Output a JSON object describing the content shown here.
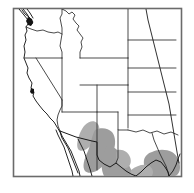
{
  "figure": {
    "type": "range-map",
    "region": "Western United States and northern Mexico",
    "title": "",
    "caption": "",
    "background_color": "#ffffff"
  },
  "frame": {
    "present": true,
    "stroke_color": "#6b6b6b",
    "x": 13,
    "y": 8,
    "width": 169,
    "height": 169
  },
  "legend": {
    "present": false,
    "entries": [
      {
        "label": "",
        "swatch_color": "#9d9d9d",
        "meaning": "shaded distribution range"
      },
      {
        "label": "",
        "swatch_color": "#141414",
        "meaning": "isolated locality record"
      }
    ]
  },
  "map_layers": {
    "state_boundaries": {
      "label": "",
      "stroke_color": "#2b2b2b",
      "visible": true
    },
    "coastline": {
      "label": "",
      "stroke_color": "#1a1a1a",
      "visible": true
    },
    "international_boundary": {
      "label": "",
      "stroke_color": "#1a1a1a",
      "visible": true
    },
    "reference_line": {
      "label": "",
      "stroke_color": "#1a1a1a",
      "visible": true
    }
  },
  "range_shading": {
    "fill_color": "#9d9d9d",
    "soft_fill_color": "#aeaeae",
    "areas": [
      "southeastern Arizona",
      "southern New Mexico",
      "west Texas",
      "northern Mexico border",
      "south Texas"
    ]
  },
  "locality_marks": {
    "fill_color": "#141414",
    "points": [
      "Puget Sound, Washington",
      "San Francisco Bay, California"
    ]
  },
  "states_depicted": [
    "Washington",
    "Oregon",
    "Idaho",
    "Montana",
    "Wyoming",
    "California",
    "Nevada",
    "Utah",
    "Colorado",
    "Arizona",
    "New Mexico",
    "Texas",
    "North Dakota",
    "South Dakota",
    "Nebraska",
    "Kansas",
    "Oklahoma"
  ]
}
